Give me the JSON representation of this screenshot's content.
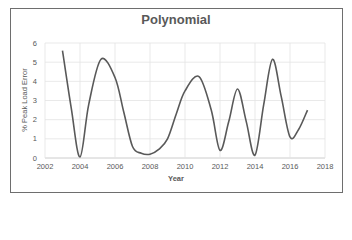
{
  "chart_data": {
    "type": "line",
    "title": "Polynomial",
    "xlabel": "Year",
    "ylabel": "% Peak Load Error",
    "xlim": [
      2002,
      2018
    ],
    "ylim": [
      0,
      6
    ],
    "x_ticks": [
      "2002",
      "2004",
      "2006",
      "2008",
      "2010",
      "2012",
      "2014",
      "2016",
      "2018"
    ],
    "y_ticks": [
      "0",
      "1",
      "2",
      "3",
      "4",
      "5",
      "6"
    ],
    "grid": true,
    "legend": null,
    "smooth": true,
    "line_color": "#595959",
    "series": [
      {
        "name": "Polynomial",
        "x": [
          2003,
          2003.5,
          2004,
          2004.5,
          2005.2,
          2006,
          2006.5,
          2007,
          2007.5,
          2008,
          2008.5,
          2009,
          2009.5,
          2010,
          2010.8,
          2011.5,
          2012,
          2012.5,
          2013,
          2013.5,
          2014,
          2014.5,
          2015,
          2015.5,
          2016,
          2016.5,
          2017
        ],
        "values": [
          5.6,
          2.6,
          0.05,
          2.8,
          5.15,
          4.2,
          2.4,
          0.6,
          0.25,
          0.2,
          0.45,
          1.0,
          2.3,
          3.5,
          4.25,
          2.5,
          0.4,
          1.9,
          3.6,
          1.9,
          0.15,
          2.8,
          5.15,
          3.2,
          1.1,
          1.5,
          2.5
        ]
      }
    ]
  },
  "cutoff_text": "Figure caption text (partially visible, cut off at bottom)"
}
